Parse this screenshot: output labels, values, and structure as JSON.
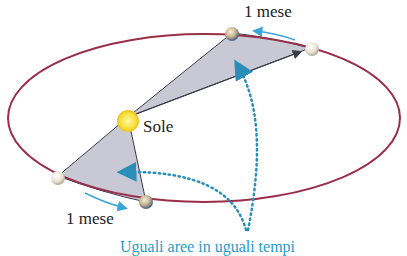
{
  "diagram": {
    "labels": {
      "sun": "Sole",
      "interval_top": "1 mese",
      "interval_bottom": "1 mese",
      "caption": "Uguali aree in uguali tempi"
    },
    "colors": {
      "orbit": "#9a2e4a",
      "sector_fill": "#c9c9d6",
      "sector_stroke": "#3a3a4a",
      "sun": "#f7e23a",
      "motion_arrow": "#3aa6d8",
      "dotted_arrow": "#2a8fb8",
      "caption": "#2a9bc9"
    }
  }
}
